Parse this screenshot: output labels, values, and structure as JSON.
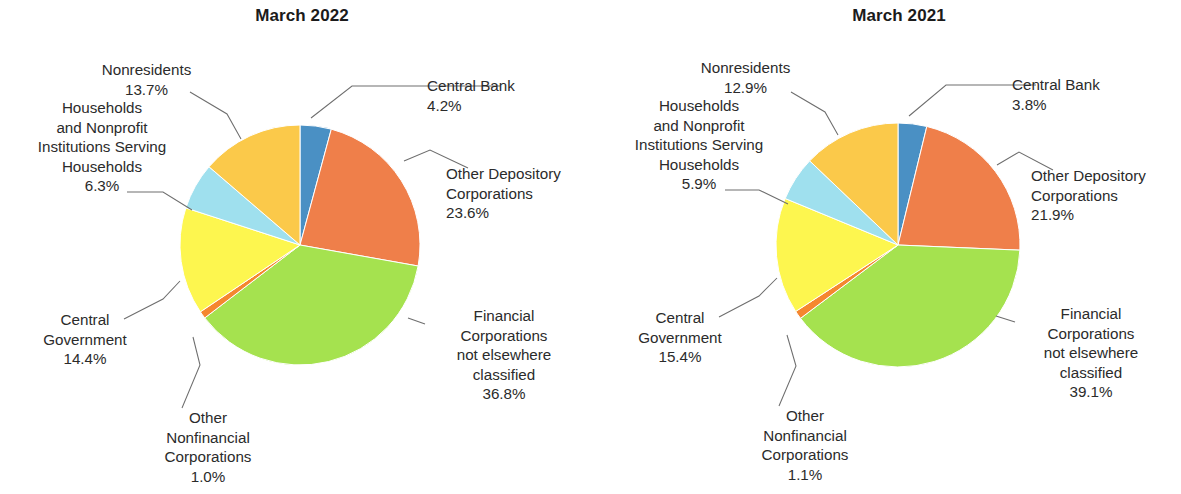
{
  "chart_data": [
    {
      "type": "pie",
      "title": "March 2022",
      "categories": [
        "Central Bank",
        "Other Depository Corporations",
        "Financial Corporations not elsewhere classified",
        "Other Nonfinancial Corporations",
        "Central Government",
        "Households and Nonprofit Institutions Serving Households",
        "Nonresidents"
      ],
      "values": [
        4.2,
        23.6,
        36.8,
        1.0,
        14.4,
        6.3,
        13.7
      ],
      "value_labels": [
        "4.2%",
        "23.6%",
        "36.8%",
        "1.0%",
        "14.4%",
        "6.3%",
        "13.7%"
      ],
      "colors": [
        "#4a90c4",
        "#ef7f4a",
        "#a5e24f",
        "#f5872f",
        "#fdf64f",
        "#9fe0ee",
        "#fbc94a"
      ],
      "start_angle_deg": 0,
      "direction": "clockwise",
      "units": "percent",
      "legend": "none",
      "grid": false,
      "labels": [
        {
          "name": "central-bank",
          "lines": "Central Bank\n4.2%"
        },
        {
          "name": "other-depository-corporations",
          "lines": "Other Depository\nCorporations\n23.6%"
        },
        {
          "name": "financial-corporations-nec",
          "lines": "Financial\nCorporations\nnot elsewhere\nclassified\n36.8%"
        },
        {
          "name": "other-nonfinancial-corporations",
          "lines": "Other\nNonfinancial\nCorporations\n1.0%"
        },
        {
          "name": "central-government",
          "lines": "Central\nGovernment\n14.4%"
        },
        {
          "name": "households-npish",
          "lines": "Households\nand Nonprofit\nInstitutions Serving\nHouseholds\n6.3%"
        },
        {
          "name": "nonresidents",
          "lines": "Nonresidents\n13.7%"
        }
      ]
    },
    {
      "type": "pie",
      "title": "March 2021",
      "categories": [
        "Central Bank",
        "Other Depository Corporations",
        "Financial Corporations not elsewhere classified",
        "Other Nonfinancial Corporations",
        "Central Government",
        "Households and Nonprofit Institutions Serving Households",
        "Nonresidents"
      ],
      "values": [
        3.8,
        21.9,
        39.1,
        1.1,
        15.4,
        5.9,
        12.9
      ],
      "value_labels": [
        "3.8%",
        "21.9%",
        "39.1%",
        "1.1%",
        "15.4%",
        "5.9%",
        "12.9%"
      ],
      "colors": [
        "#4a90c4",
        "#ef7f4a",
        "#a5e24f",
        "#f5872f",
        "#fdf64f",
        "#9fe0ee",
        "#fbc94a"
      ],
      "start_angle_deg": 0,
      "direction": "clockwise",
      "units": "percent",
      "legend": "none",
      "grid": false,
      "labels": [
        {
          "name": "central-bank",
          "lines": "Central Bank\n3.8%"
        },
        {
          "name": "other-depository-corporations",
          "lines": "Other Depository\nCorporations\n21.9%"
        },
        {
          "name": "financial-corporations-nec",
          "lines": "Financial\nCorporations\nnot elsewhere\nclassified\n39.1%"
        },
        {
          "name": "other-nonfinancial-corporations",
          "lines": "Other\nNonfinancial\nCorporations\n1.1%"
        },
        {
          "name": "central-government",
          "lines": "Central\nGovernment\n15.4%"
        },
        {
          "name": "households-npish",
          "lines": "Households\nand Nonprofit\nInstitutions Serving\nHouseholds\n5.9%"
        },
        {
          "name": "nonresidents",
          "lines": "Nonresidents\n12.9%"
        }
      ]
    }
  ]
}
